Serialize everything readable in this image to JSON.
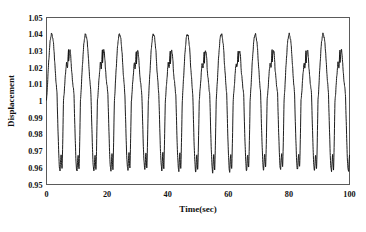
{
  "figure": {
    "background_color": "#ffffff",
    "frame_color": "#5a5a5a",
    "line_color": "#111111"
  },
  "chart_data": {
    "type": "line",
    "title": "",
    "subtitle": "",
    "xlabel": "Time(sec)",
    "ylabel": "Displacement",
    "xlim": [
      0,
      100
    ],
    "ylim": [
      0.95,
      1.05
    ],
    "grid": false,
    "legend": null,
    "legend_position": "none",
    "xticks": [
      0,
      20,
      40,
      60,
      80,
      100
    ],
    "xtick_labels": [
      "0",
      "20",
      "40",
      "60",
      "80",
      "100"
    ],
    "yticks": [
      0.95,
      0.96,
      0.97,
      0.98,
      0.99,
      1.0,
      1.01,
      1.02,
      1.03,
      1.04,
      1.05
    ],
    "ytick_labels": [
      "0.95",
      "0.96",
      "0.97",
      "0.98",
      "0.99",
      "1",
      "1.01",
      "1.02",
      "1.03",
      "1.04",
      "1.05"
    ],
    "series": [
      {
        "name": "Displacement",
        "color": "#111111",
        "period_sec": 5.6,
        "cycle_count": 18,
        "tall_peak_value": 1.04,
        "short_peak_value": 1.03,
        "trough_value": 0.96,
        "deep_trough_value": 0.9575,
        "notch_trough_value": 0.968,
        "baseline_value": 1.0,
        "x": [
          0.0,
          0.5,
          0.9,
          1.3,
          1.7,
          2.0,
          2.4,
          2.8,
          3.2,
          3.6,
          4.0,
          4.4,
          4.7,
          5.0,
          5.3,
          5.6,
          5.9,
          6.3,
          6.7,
          7.1,
          7.4,
          7.7,
          8.0,
          8.3,
          8.7,
          9.1,
          9.5,
          9.9,
          10.3,
          10.7,
          11.0,
          11.2,
          11.5,
          11.8,
          12.2,
          12.6,
          13.0,
          13.4,
          13.7,
          14.0,
          14.4,
          14.8,
          15.2,
          15.6,
          16.0,
          16.4,
          16.7,
          17.0,
          17.3,
          17.6,
          18.0,
          18.4,
          18.8,
          19.2,
          19.5,
          19.8,
          20.1,
          20.4,
          20.8,
          21.2,
          21.6,
          22.0,
          22.4,
          22.8,
          23.1,
          23.4,
          23.7,
          24.0,
          24.4,
          24.8,
          25.2,
          25.6,
          26.0,
          26.4,
          26.8,
          27.2,
          27.5,
          27.8,
          28.2,
          28.6,
          29.0,
          29.4,
          29.8,
          30.2,
          30.5,
          30.8,
          31.2,
          31.6,
          32.0,
          32.4,
          32.8,
          33.2,
          33.5,
          33.8,
          34.2,
          34.6,
          35.0,
          35.4,
          35.8,
          36.2,
          36.5,
          36.8,
          37.2,
          37.6,
          38.0,
          38.4,
          38.8,
          39.2,
          39.5,
          39.8,
          40.2,
          40.6,
          41.0,
          41.4,
          41.8,
          42.2,
          42.6,
          43.0,
          43.3,
          43.6,
          44.0,
          44.4,
          44.8,
          45.2,
          45.5,
          45.8,
          46.2,
          46.6,
          47.0,
          47.4,
          47.8,
          48.2,
          48.6,
          49.0,
          49.4,
          49.8,
          50.2,
          50.6,
          51.0,
          51.4,
          51.8,
          52.2,
          52.6,
          53.0,
          53.4,
          53.8,
          54.2,
          54.6,
          55.0,
          55.4,
          55.8,
          56.2,
          56.6,
          57.0,
          57.4,
          57.8,
          58.2,
          58.6,
          59.0,
          59.4,
          59.8,
          60.2,
          60.6,
          61.0,
          61.4,
          61.8,
          62.2,
          62.6,
          63.0,
          63.4,
          63.8,
          64.2,
          64.6,
          65.0,
          65.4,
          65.8,
          66.2,
          66.6,
          67.0,
          67.4,
          67.8,
          68.2,
          68.6,
          69.0,
          69.4,
          69.8,
          70.2,
          70.6,
          71.0,
          71.4,
          71.8,
          72.2,
          72.6,
          73.0,
          73.4,
          73.8,
          74.2,
          74.6,
          75.0,
          75.4,
          75.8,
          76.2,
          76.6,
          77.0,
          77.4,
          77.8,
          78.2,
          78.6,
          79.0,
          79.4,
          79.8,
          80.2,
          80.6,
          81.0,
          81.4,
          81.8,
          82.2,
          82.6,
          83.0,
          83.4,
          83.8,
          84.2,
          84.6,
          85.0,
          85.4,
          85.8,
          86.2,
          86.6,
          87.0,
          87.4,
          87.8,
          88.2,
          88.6,
          89.0,
          89.4,
          89.8,
          90.2,
          90.6,
          91.0,
          91.4,
          91.8,
          92.2,
          92.6,
          93.0,
          93.4,
          93.8,
          94.2,
          94.6,
          95.0,
          95.4,
          95.8,
          96.2,
          96.6,
          97.0,
          97.4,
          97.8,
          98.2,
          98.6,
          99.0,
          99.4,
          99.8,
          100.0
        ],
        "note": "Quasi-periodic beating displacement signal; y values generated parametrically in the template from the stated peak/trough envelope parameters."
      }
    ]
  },
  "axes": {
    "y_axis_title": "Displacement",
    "x_axis_title": "Time(sec)"
  }
}
